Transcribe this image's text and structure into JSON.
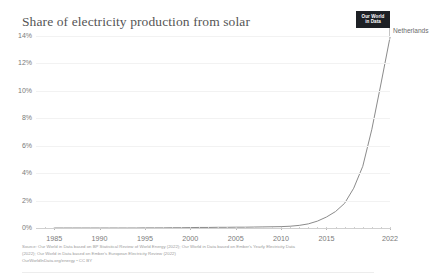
{
  "header": {
    "title": "Share of electricity production from solar",
    "logo_line1": "Our World",
    "logo_line2": "in Data",
    "logo_name": "our-world-in-data-logo"
  },
  "chart_data": {
    "type": "line",
    "title": "Share of electricity production from solar",
    "xlabel": "",
    "ylabel": "",
    "xlim": [
      1983,
      2022
    ],
    "ylim": [
      0,
      14
    ],
    "grid": true,
    "legend_position": "end-of-line",
    "y_tick_labels": [
      "0%",
      "2%",
      "4%",
      "6%",
      "8%",
      "10%",
      "12%",
      "14%"
    ],
    "y_tick_values": [
      0,
      2,
      4,
      6,
      8,
      10,
      12,
      14
    ],
    "x_tick_labels": [
      "1985",
      "1990",
      "1995",
      "2000",
      "2005",
      "2010",
      "2015",
      "2022"
    ],
    "x_tick_values": [
      1985,
      1990,
      1995,
      2000,
      2005,
      2010,
      2015,
      2022
    ],
    "series": [
      {
        "name": "Netherlands",
        "color": "#8b8b8b",
        "x": [
          1985,
          1986,
          1987,
          1988,
          1989,
          1990,
          1991,
          1992,
          1993,
          1994,
          1995,
          1996,
          1997,
          1998,
          1999,
          2000,
          2001,
          2002,
          2003,
          2004,
          2005,
          2006,
          2007,
          2008,
          2009,
          2010,
          2011,
          2012,
          2013,
          2014,
          2015,
          2016,
          2017,
          2018,
          2019,
          2020,
          2021,
          2022
        ],
        "values": [
          0,
          0,
          0,
          0,
          0,
          0,
          0,
          0,
          0,
          0,
          0.01,
          0.01,
          0.01,
          0.02,
          0.02,
          0.03,
          0.04,
          0.04,
          0.05,
          0.05,
          0.06,
          0.06,
          0.07,
          0.08,
          0.09,
          0.1,
          0.13,
          0.19,
          0.3,
          0.5,
          0.8,
          1.2,
          1.8,
          2.9,
          4.5,
          7.2,
          10.5,
          13.9
        ]
      }
    ],
    "annotations": [
      {
        "text": "Netherlands",
        "x": 2022,
        "y": 13.9
      }
    ]
  },
  "footer": {
    "line1": "Source: Our World in Data based on BP Statistical Review of World Energy (2022); Our World in Data based on Ember's Yearly Electricity Data",
    "line2": "(2022); Our World in Data based on Ember's European Electricity Review (2022)",
    "line3": "OurWorldInData.org/energy • CC BY"
  }
}
